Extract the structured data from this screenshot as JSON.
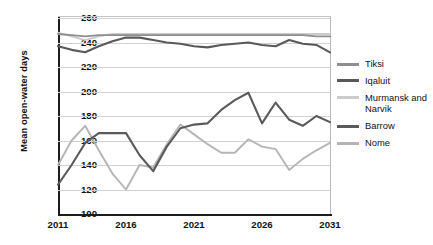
{
  "chart_data": {
    "type": "line",
    "title": "",
    "xlabel": "",
    "ylabel": "Mean open-water days",
    "xlim": [
      2011,
      2031
    ],
    "ylim": [
      100,
      260
    ],
    "yticks": [
      100,
      120,
      140,
      160,
      180,
      200,
      220,
      240,
      260
    ],
    "xticks": [
      2011,
      2016,
      2021,
      2026,
      2031
    ],
    "grid": "horizontal",
    "legend_position": "right",
    "x": [
      2011,
      2012,
      2013,
      2014,
      2015,
      2016,
      2017,
      2018,
      2019,
      2020,
      2021,
      2022,
      2023,
      2024,
      2025,
      2026,
      2027,
      2028,
      2029,
      2030,
      2031
    ],
    "series": [
      {
        "name": "Tiksi",
        "color": "#8e8e8e",
        "values": [
          247,
          246,
          245,
          246,
          246,
          246,
          246,
          246,
          246,
          246,
          246,
          246,
          246,
          246,
          246,
          246,
          246,
          246,
          246,
          245,
          245
        ]
      },
      {
        "name": "Iqaluit",
        "color": "#595959",
        "values": [
          237,
          234,
          232,
          237,
          241,
          244,
          244,
          242,
          240,
          239,
          237,
          236,
          238,
          239,
          240,
          238,
          237,
          242,
          239,
          238,
          232
        ]
      },
      {
        "name": "Murmansk and Narvik",
        "color": "#cbcbcb",
        "values": [
          248,
          245,
          242,
          245,
          247,
          247,
          247,
          247,
          247,
          247,
          247,
          247,
          247,
          247,
          247,
          247,
          247,
          247,
          247,
          247,
          247
        ]
      },
      {
        "name": "Barrow",
        "color": "#5a5a5a",
        "values": [
          124,
          140,
          158,
          166,
          166,
          166,
          148,
          135,
          155,
          170,
          173,
          174,
          185,
          193,
          199,
          174,
          191,
          177,
          172,
          180,
          175
        ]
      },
      {
        "name": "Nome",
        "color": "#b5b5b5",
        "values": [
          140,
          160,
          172,
          152,
          133,
          120,
          140,
          138,
          157,
          173,
          165,
          157,
          150,
          150,
          161,
          155,
          153,
          136,
          145,
          152,
          158
        ]
      }
    ]
  },
  "axes": {
    "ylabel": "Mean open-water days",
    "ytick_labels": [
      "260",
      "240",
      "220",
      "200",
      "180",
      "160",
      "140",
      "120",
      "100"
    ],
    "xtick_labels": [
      "2011",
      "2016",
      "2021",
      "2026",
      "2031"
    ]
  },
  "legend": {
    "entries": [
      {
        "label": "Tiksi",
        "color": "#8e8e8e"
      },
      {
        "label": "Iqaluit",
        "color": "#595959"
      },
      {
        "label": "Murmansk and Narvik",
        "color": "#cbcbcb"
      },
      {
        "label": "Barrow",
        "color": "#5a5a5a"
      },
      {
        "label": "Nome",
        "color": "#b5b5b5"
      }
    ]
  }
}
